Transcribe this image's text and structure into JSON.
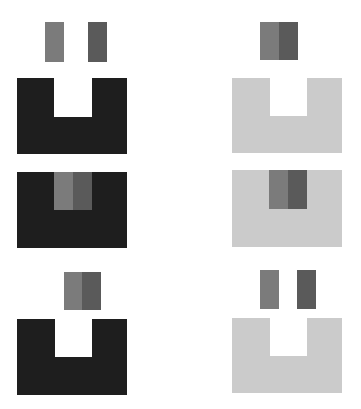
{
  "colors": {
    "dark": "#1e1e1e",
    "light": "#cbcbcb",
    "block_a": "#7b7b7b",
    "block_b": "#5a5a5a",
    "background": "#ffffff"
  },
  "panels": [
    {
      "id": "top-left",
      "base": "u-shape",
      "base_color": "dark",
      "blocks": "separated-above"
    },
    {
      "id": "top-right",
      "base": "u-shape",
      "base_color": "light",
      "blocks": "joined-above"
    },
    {
      "id": "middle-left",
      "base": "rectangle",
      "base_color": "dark",
      "blocks": "joined-inset"
    },
    {
      "id": "middle-right",
      "base": "rectangle",
      "base_color": "light",
      "blocks": "joined-inset"
    },
    {
      "id": "bottom-left",
      "base": "u-shape",
      "base_color": "dark",
      "blocks": "joined-above-offset"
    },
    {
      "id": "bottom-right",
      "base": "u-shape",
      "base_color": "light",
      "blocks": "separated-above"
    }
  ]
}
